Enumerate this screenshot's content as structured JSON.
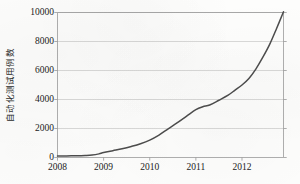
{
  "chart_data": {
    "type": "line",
    "title": "",
    "xlabel": "",
    "ylabel": "自动化测试用例数",
    "xlim": [
      2008,
      2012.9
    ],
    "ylim": [
      0,
      10000
    ],
    "grid": true,
    "legend": false,
    "legend_position": "none",
    "line_color": "#4d4d4d",
    "grid_color": "#c9c9c9",
    "axis_color": "#9a9a9a",
    "x_tick_labels": [
      "2008",
      "2009",
      "2010",
      "2011",
      "2012"
    ],
    "x_ticks": [
      2008,
      2009,
      2010,
      2011,
      2012
    ],
    "y_tick_labels": [
      "0",
      "2000",
      "4000",
      "6000",
      "8000",
      "10000"
    ],
    "y_ticks": [
      0,
      2000,
      4000,
      6000,
      8000,
      10000
    ],
    "series": [
      {
        "name": "自动化测试用例数",
        "x": [
          2008.0,
          2008.2,
          2008.4,
          2008.6,
          2008.75,
          2008.9,
          2009.0,
          2009.2,
          2009.4,
          2009.6,
          2009.8,
          2010.0,
          2010.2,
          2010.4,
          2010.6,
          2010.8,
          2011.0,
          2011.15,
          2011.3,
          2011.5,
          2011.7,
          2011.85,
          2012.0,
          2012.15,
          2012.3,
          2012.45,
          2012.6,
          2012.75,
          2012.9
        ],
        "values": [
          100,
          110,
          120,
          140,
          170,
          250,
          340,
          470,
          600,
          760,
          950,
          1200,
          1550,
          1980,
          2400,
          2850,
          3300,
          3500,
          3620,
          3950,
          4300,
          4650,
          5000,
          5450,
          6100,
          6900,
          7800,
          8900,
          10050
        ]
      }
    ]
  },
  "axis_label": {
    "y": "自动化测试用例数"
  },
  "caption": {
    "text": ""
  }
}
